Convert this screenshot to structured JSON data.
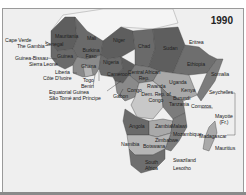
{
  "map": {
    "year": "1990",
    "colors": {
      "background": "#efefef",
      "dark": "#5e5e5e",
      "medium": "#7c7c7c",
      "light": "#a9a9a9",
      "lightest": "#c8c8c8",
      "non_africa": "#f4f4f4"
    },
    "labels": {
      "cape_verde": "Cape Verde",
      "the_gambia": "The Gambia",
      "guinea_bissau": "Guinea-Bissau",
      "sierra_leone": "Sierra Leone",
      "liberia": "Liberia",
      "cote_divoire": "Côte D'Ivoire",
      "togo": "Togo",
      "benin": "Benin",
      "equatorial_guinea": "Equatorial Guinea",
      "sao_tome": "São Tomé and Príncipe",
      "mauritania": "Mauritania",
      "mali": "Mali",
      "niger": "Niger",
      "chad": "Chad",
      "sudan": "Sudan",
      "eritrea": "Eritrea",
      "ethiopia": "Ethiopia",
      "somalia": "Somalia",
      "senegal": "Senegal",
      "guinea": "Guinea",
      "burkina_faso": "Burkina Faso",
      "ghana": "Ghana",
      "nigeria": "Nigeria",
      "cameroon": "Cameroon",
      "central_african_rep": "Central African Rep.",
      "gabon": "Gabon",
      "congo": "Congo",
      "rwanda": "Rwanda",
      "uganda": "Uganda",
      "kenya": "Kenya",
      "burundi": "Burundi",
      "dem_rep_congo": "Dem. Rep. of Congo",
      "tanzania": "Tanzania",
      "seychelles": "Seychelles",
      "comoros": "Comoros",
      "mayotte": "Mayotte (Fr.)",
      "angola": "Angola",
      "zambia": "Zambia",
      "malawi": "Malawi",
      "mozambique": "Mozambique",
      "zimbabwe": "Zimbabwe",
      "namibia": "Namibia",
      "botswana": "Botswana",
      "madagascar": "Madagascar",
      "mauritius": "Mauritius",
      "south_africa": "South Africa",
      "swaziland": "Swaziland",
      "lesotho": "Lesotho"
    }
  }
}
